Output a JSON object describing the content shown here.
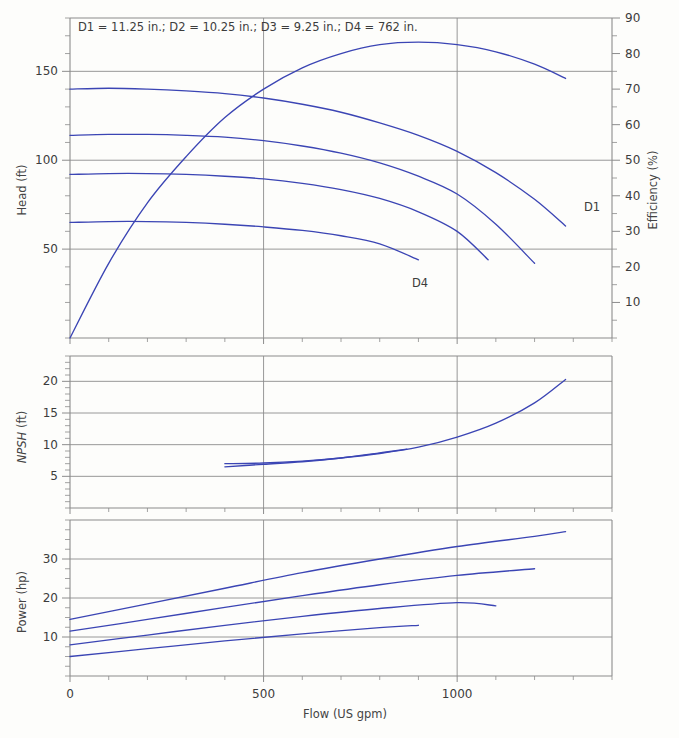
{
  "figure": {
    "title": "",
    "annotation": "D1 = 11.25 in.; D2 = 10.25 in.; D3 = 9.25 in.; D4 = 762 in.",
    "curve_color": "#3b45b4",
    "grid_color": "#8c8c8c",
    "background": "#fdfdfb"
  },
  "axes": {
    "x": {
      "label": "Flow (US gpm)",
      "ticks": [
        0,
        500,
        1000
      ],
      "tick_labels": [
        "0",
        "500",
        "1000"
      ],
      "minor_step": 100,
      "range": [
        0,
        1400
      ]
    },
    "head": {
      "label": "Head (ft)",
      "ticks": [
        50,
        100,
        150
      ],
      "tick_labels": [
        "50",
        "100",
        "150"
      ],
      "minor_step": 10,
      "range": [
        0,
        180
      ]
    },
    "efficiency": {
      "label": "Efficiency (%)",
      "ticks": [
        10,
        20,
        30,
        40,
        50,
        60,
        70,
        80,
        90
      ],
      "tick_labels": [
        "10",
        "20",
        "30",
        "40",
        "50",
        "60",
        "70",
        "80",
        "90"
      ],
      "minor_step": 5,
      "range": [
        0,
        90
      ]
    },
    "npsh": {
      "label": "NPSH (ft)",
      "label_italic_part": "NPSH",
      "label_roman_part": " (ft)",
      "ticks": [
        5,
        10,
        15,
        20
      ],
      "tick_labels": [
        "5",
        "10",
        "15",
        "20"
      ],
      "minor_step": 1,
      "range": [
        0,
        24
      ]
    },
    "power": {
      "label": "Power (hp)",
      "ticks": [
        10,
        20,
        30
      ],
      "tick_labels": [
        "10",
        "20",
        "30"
      ],
      "minor_step": 2.5,
      "range": [
        0,
        40
      ]
    }
  },
  "curve_labels": {
    "d1": "D1",
    "d4": "D4"
  },
  "chart_data": {
    "type": "line",
    "xlabel": "Flow (US gpm)",
    "ylabel": "Head (ft)",
    "xlim": [
      0,
      1400
    ],
    "grid": true,
    "legend": "inline-labels",
    "panels": [
      {
        "name": "head-efficiency",
        "ylabel": "Head (ft)",
        "ylim": [
          0,
          180
        ],
        "y2label": "Efficiency (%)",
        "y2lim": [
          0,
          90
        ],
        "series": [
          {
            "name": "D1",
            "axis": "head",
            "impeller_in": 11.25,
            "x": [
              0,
              100,
              200,
              300,
              400,
              500,
              600,
              700,
              800,
              900,
              1000,
              1100,
              1200,
              1280
            ],
            "y": [
              140,
              140.5,
              140,
              139,
              137.5,
              135,
              131.5,
              127,
              121,
              114,
              105,
              93,
              78,
              63
            ]
          },
          {
            "name": "D2",
            "axis": "head",
            "impeller_in": 10.25,
            "x": [
              0,
              100,
              200,
              300,
              400,
              500,
              600,
              700,
              800,
              900,
              1000,
              1100,
              1200
            ],
            "y": [
              114,
              114.5,
              114.5,
              114,
              113,
              111,
              108,
              104,
              98.5,
              91,
              81,
              64,
              42
            ]
          },
          {
            "name": "D3",
            "axis": "head",
            "impeller_in": 9.25,
            "x": [
              0,
              100,
              200,
              300,
              400,
              500,
              600,
              700,
              800,
              900,
              1000,
              1080
            ],
            "y": [
              92,
              92.5,
              92.5,
              92,
              91,
              89.5,
              87,
              83.5,
              78.5,
              71,
              60,
              44
            ]
          },
          {
            "name": "D4",
            "axis": "head",
            "impeller_in": 7.62,
            "x": [
              0,
              100,
              200,
              300,
              400,
              500,
              600,
              700,
              800,
              900
            ],
            "y": [
              65,
              65.5,
              65.5,
              65,
              64,
              62.5,
              60.5,
              57.5,
              53,
              44
            ]
          },
          {
            "name": "Efficiency",
            "axis": "efficiency",
            "x": [
              0,
              100,
              200,
              300,
              400,
              500,
              600,
              700,
              800,
              900,
              1000,
              1100,
              1200,
              1280
            ],
            "y": [
              0,
              21,
              38,
              51,
              62,
              70,
              76,
              80,
              82.5,
              83.2,
              82.5,
              80.5,
              77,
              73
            ]
          }
        ]
      },
      {
        "name": "npsh",
        "ylabel": "NPSH (ft)",
        "ylim": [
          0,
          24
        ],
        "series": [
          {
            "name": "NPSH-a",
            "x": [
              400,
              500,
              600,
              700,
              800,
              900,
              1000,
              1100,
              1200,
              1280
            ],
            "y": [
              7.0,
              7.1,
              7.4,
              7.9,
              8.6,
              9.6,
              11.2,
              13.4,
              16.6,
              20.3
            ]
          },
          {
            "name": "NPSH-b",
            "x": [
              400,
              500,
              600,
              700,
              800,
              870
            ],
            "y": [
              6.5,
              6.9,
              7.3,
              7.9,
              8.7,
              9.3
            ]
          }
        ]
      },
      {
        "name": "power",
        "ylabel": "Power (hp)",
        "ylim": [
          0,
          40
        ],
        "series": [
          {
            "name": "D1",
            "x": [
              0,
              200,
              400,
              600,
              800,
              1000,
              1200,
              1280
            ],
            "y": [
              14.5,
              18.5,
              22.5,
              26.5,
              30.0,
              33.2,
              35.8,
              37.0
            ]
          },
          {
            "name": "D2",
            "x": [
              0,
              200,
              400,
              600,
              800,
              1000,
              1200
            ],
            "y": [
              11.5,
              14.5,
              17.6,
              20.6,
              23.4,
              25.8,
              27.5
            ]
          },
          {
            "name": "D3",
            "x": [
              0,
              200,
              400,
              600,
              800,
              1000,
              1100
            ],
            "y": [
              8.0,
              10.5,
              13.0,
              15.3,
              17.3,
              18.8,
              18.0
            ]
          },
          {
            "name": "D4",
            "x": [
              0,
              200,
              400,
              600,
              800,
              900
            ],
            "y": [
              5.0,
              7.0,
              9.0,
              10.8,
              12.4,
              13.0
            ]
          }
        ]
      }
    ]
  }
}
